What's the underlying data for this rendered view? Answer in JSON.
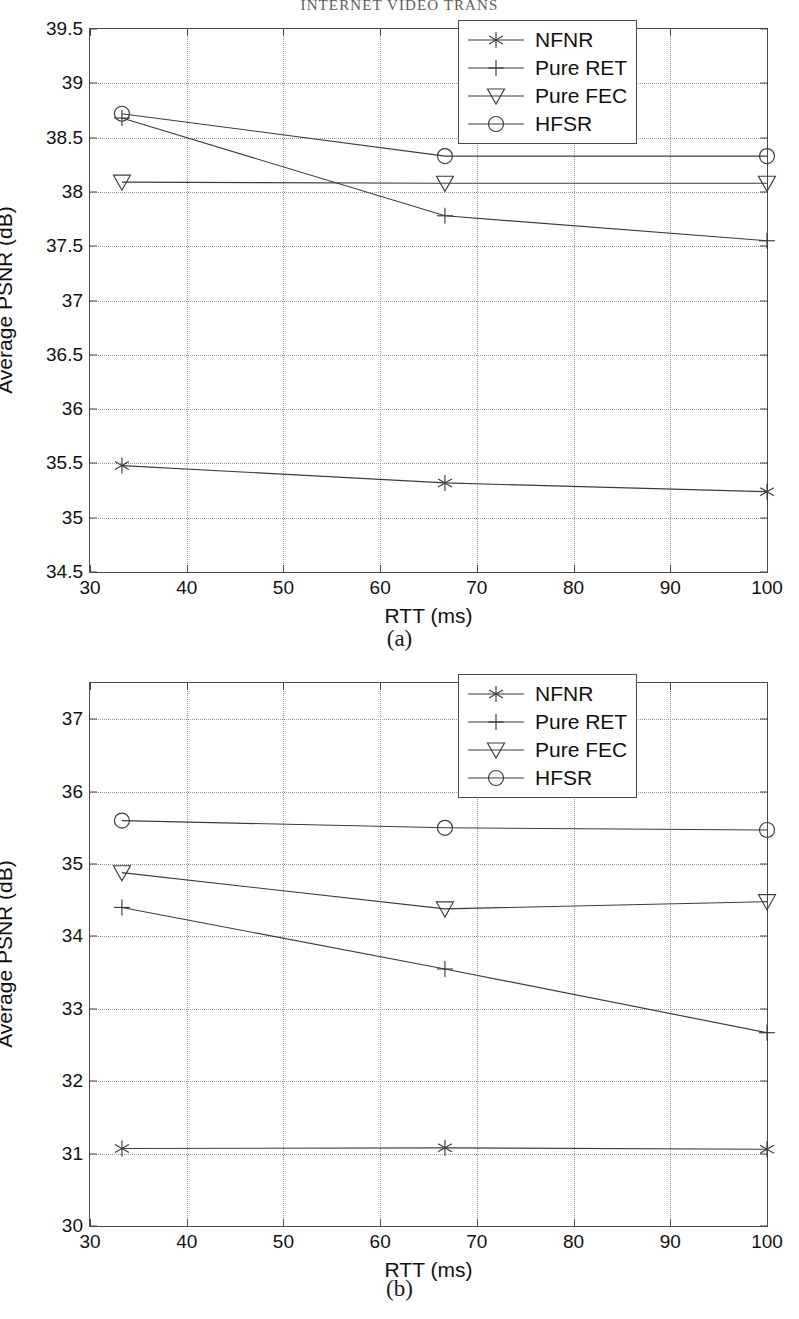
{
  "running_head": "INTERNET VIDEO TRANS",
  "figure": {
    "subfigures": [
      {
        "caption": "(a)"
      },
      {
        "caption": "(b)"
      }
    ]
  },
  "legend": {
    "entries": [
      {
        "label": "NFNR",
        "marker": "asterisk"
      },
      {
        "label": "Pure RET",
        "marker": "plus"
      },
      {
        "label": "Pure FEC",
        "marker": "triangle-down"
      },
      {
        "label": "HFSR",
        "marker": "circle"
      }
    ]
  },
  "colors": {
    "line": "#3c3c3c",
    "axis": "#4a4a4a",
    "grid": "#9a9a9a",
    "text": "#111111"
  },
  "chart_data": [
    {
      "type": "line",
      "title": "(a)",
      "xlabel": "RTT (ms)",
      "ylabel": "Average PSNR (dB)",
      "xlim": [
        30,
        100
      ],
      "ylim": [
        34.5,
        39.5
      ],
      "xticks": [
        30,
        40,
        50,
        60,
        70,
        80,
        90,
        100
      ],
      "xtick_labels": [
        "30",
        "40",
        "50",
        "60",
        "70",
        "80",
        "90",
        "100"
      ],
      "yticks": [
        34.5,
        35,
        35.5,
        36,
        36.5,
        37,
        37.5,
        38,
        38.5,
        39,
        39.5
      ],
      "ytick_labels": [
        "34.5",
        "35",
        "35.5",
        "36",
        "36.5",
        "37",
        "37.5",
        "38",
        "38.5",
        "39",
        "39.5"
      ],
      "grid": true,
      "legend_position": "upper-right",
      "x": [
        33.3,
        66.7,
        100
      ],
      "series": [
        {
          "name": "NFNR",
          "marker": "asterisk",
          "values": [
            35.48,
            35.32,
            35.24
          ]
        },
        {
          "name": "Pure RET",
          "marker": "plus",
          "values": [
            38.68,
            37.78,
            37.55
          ]
        },
        {
          "name": "Pure FEC",
          "marker": "triangle-down",
          "values": [
            38.09,
            38.08,
            38.08
          ]
        },
        {
          "name": "HFSR",
          "marker": "circle",
          "values": [
            38.72,
            38.33,
            38.33
          ]
        }
      ]
    },
    {
      "type": "line",
      "title": "(b)",
      "xlabel": "RTT (ms)",
      "ylabel": "Average PSNR (dB)",
      "xlim": [
        30,
        100
      ],
      "ylim": [
        30,
        37.5
      ],
      "xticks": [
        30,
        40,
        50,
        60,
        70,
        80,
        90,
        100
      ],
      "xtick_labels": [
        "30",
        "40",
        "50",
        "60",
        "70",
        "80",
        "90",
        "100"
      ],
      "yticks": [
        30,
        31,
        32,
        33,
        34,
        35,
        36,
        37
      ],
      "ytick_labels": [
        "30",
        "31",
        "32",
        "33",
        "34",
        "35",
        "36",
        "37"
      ],
      "grid": true,
      "legend_position": "upper-right",
      "x": [
        33.3,
        66.7,
        100
      ],
      "series": [
        {
          "name": "NFNR",
          "marker": "asterisk",
          "values": [
            31.07,
            31.08,
            31.06
          ]
        },
        {
          "name": "Pure RET",
          "marker": "plus",
          "values": [
            34.4,
            33.55,
            32.67
          ]
        },
        {
          "name": "Pure FEC",
          "marker": "triangle-down",
          "values": [
            34.88,
            34.38,
            34.48
          ]
        },
        {
          "name": "HFSR",
          "marker": "circle",
          "values": [
            35.6,
            35.5,
            35.47
          ]
        }
      ]
    }
  ]
}
